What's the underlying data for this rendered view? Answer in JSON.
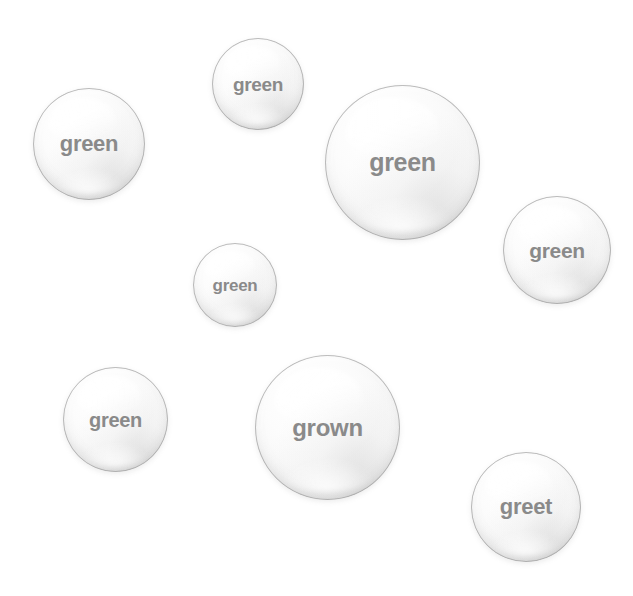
{
  "canvas": {
    "width": 633,
    "height": 596,
    "background_color": "#ffffff"
  },
  "style": {
    "text_color": "#8a8a8a",
    "bubble_rim_color": "#9e9e9e",
    "bubble_fill_color": "#fdfdfd"
  },
  "bubbles": [
    {
      "id": "bubble-top-green",
      "label": "green",
      "x": 212,
      "y": 38,
      "diameter": 92,
      "font_size": 19
    },
    {
      "id": "bubble-top-left-green",
      "label": "green",
      "x": 33,
      "y": 88,
      "diameter": 112,
      "font_size": 22
    },
    {
      "id": "bubble-large-right-green",
      "label": "green",
      "x": 325,
      "y": 85,
      "diameter": 155,
      "font_size": 25
    },
    {
      "id": "bubble-right-green",
      "label": "green",
      "x": 503,
      "y": 196,
      "diameter": 108,
      "font_size": 21
    },
    {
      "id": "bubble-small-center-green",
      "label": "green",
      "x": 193,
      "y": 243,
      "diameter": 84,
      "font_size": 17
    },
    {
      "id": "bubble-lower-left-green",
      "label": "green",
      "x": 63,
      "y": 367,
      "diameter": 105,
      "font_size": 20
    },
    {
      "id": "bubble-large-bottom-grown",
      "label": "grown",
      "x": 255,
      "y": 355,
      "diameter": 145,
      "font_size": 24
    },
    {
      "id": "bubble-bottom-right-greet",
      "label": "greet",
      "x": 471,
      "y": 452,
      "diameter": 110,
      "font_size": 22
    }
  ]
}
